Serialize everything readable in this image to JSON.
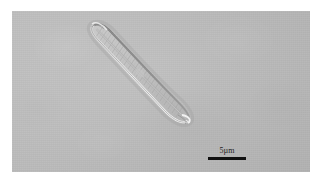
{
  "figure": {
    "kind": "light-microscopy-micrograph",
    "panel": {
      "x": 12,
      "y": 11,
      "width": 298,
      "height": 161,
      "page_background_color": "#ffffff",
      "field_background_color": "#b9b9b9"
    }
  },
  "scale_bar": {
    "label": "5µm",
    "value": 5,
    "unit": "µm",
    "bar_color": "#101010",
    "bar_length_px": 38,
    "bar_thickness_px": 3,
    "position": {
      "x": 208,
      "y": 155
    }
  },
  "specimen": {
    "name": "diatom",
    "shape": "lanceolate",
    "orientation": "diagonal",
    "apex_upper_left": {
      "x": 93,
      "y": 25
    },
    "apex_lower_right": {
      "x": 186,
      "y": 116
    },
    "outline_color": "#8c8c8c",
    "highlight_color": "#e8e8e8",
    "interior_color": "#c2c2c2",
    "features": [
      "raphe",
      "striae",
      "central-area",
      "valve-margin"
    ]
  }
}
